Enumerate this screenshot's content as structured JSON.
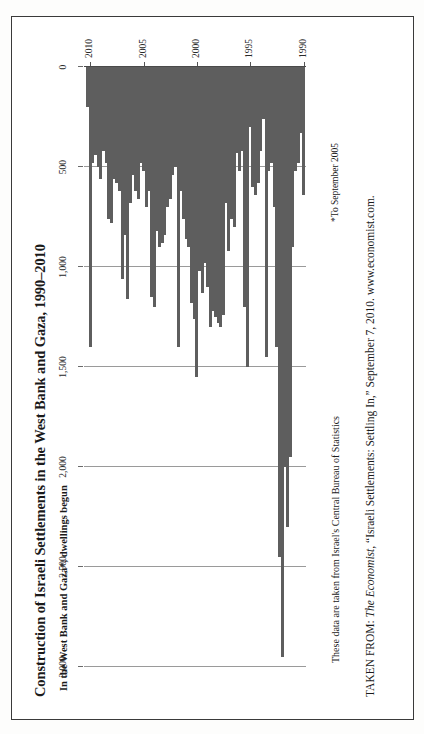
{
  "figure": {
    "title": "Construction of Israeli Settlements in the West Bank and Gaza, 1990–2010",
    "subtitle": "In the West Bank and Gaza*, dwellings begun",
    "footnote": "*To September 2005",
    "source_note": "These data are taken from Israel's Central Bureau of Statistics",
    "credit_prefix": "TAKEN FROM: ",
    "credit_italic": "The Economist",
    "credit_rest": ", “Israeli Settlements: Settling In,” September 7, 2010. www.economist.com.",
    "border_color": "#3a3a3a",
    "bar_color": "#5e5e5e",
    "grid_color": "#9a9a9a"
  },
  "chart_data": {
    "type": "bar",
    "title": "Construction of Israeli Settlements in the West Bank and Gaza, 1990–2010",
    "subtitle": "In the West Bank and Gaza*, dwellings begun",
    "orientation": "vertical-bars-printed-sideways",
    "xlabel": "",
    "ylabel": "dwellings begun",
    "ylim": [
      0,
      3000
    ],
    "yticks": [
      0,
      500,
      1000,
      1500,
      2000,
      2500,
      3000
    ],
    "ytick_labels": [
      "0",
      "500",
      "1,000",
      "1,500",
      "2,000",
      "2,500",
      "3,000"
    ],
    "grid": true,
    "legend": "none",
    "xticks": [
      1990,
      1995,
      2000,
      2005,
      2010
    ],
    "xtick_labels": [
      "1990",
      "1995",
      "2000",
      "2005",
      "2010"
    ],
    "frequency": "quarterly",
    "x": [
      1990.0,
      1990.25,
      1990.5,
      1990.75,
      1991.0,
      1991.25,
      1991.5,
      1991.75,
      1992.0,
      1992.25,
      1992.5,
      1992.75,
      1993.0,
      1993.25,
      1993.5,
      1993.75,
      1994.0,
      1994.25,
      1994.5,
      1994.75,
      1995.0,
      1995.25,
      1995.5,
      1995.75,
      1996.0,
      1996.25,
      1996.5,
      1996.75,
      1997.0,
      1997.25,
      1997.5,
      1997.75,
      1998.0,
      1998.25,
      1998.5,
      1998.75,
      1999.0,
      1999.25,
      1999.5,
      1999.75,
      2000.0,
      2000.25,
      2000.5,
      2000.75,
      2001.0,
      2001.25,
      2001.5,
      2001.75,
      2002.0,
      2002.25,
      2002.5,
      2002.75,
      2003.0,
      2003.25,
      2003.5,
      2003.75,
      2004.0,
      2004.25,
      2004.5,
      2004.75,
      2005.0,
      2005.25,
      2005.5,
      2005.75,
      2006.0,
      2006.25,
      2006.5,
      2006.75,
      2007.0,
      2007.25,
      2007.5,
      2007.75,
      2008.0,
      2008.25,
      2008.5,
      2008.75,
      2009.0,
      2009.25,
      2009.5,
      2009.75,
      2010.0,
      2010.25
    ],
    "values": [
      640,
      330,
      480,
      520,
      900,
      1950,
      2300,
      2000,
      2950,
      2450,
      1400,
      700,
      480,
      520,
      1450,
      260,
      420,
      580,
      640,
      600,
      300,
      1500,
      1200,
      420,
      520,
      430,
      800,
      760,
      920,
      680,
      1240,
      1300,
      1280,
      1250,
      1220,
      1300,
      1100,
      980,
      1130,
      1020,
      1550,
      1260,
      1180,
      900,
      860,
      760,
      620,
      1400,
      500,
      540,
      660,
      700,
      840,
      880,
      900,
      820,
      1200,
      1150,
      620,
      700,
      520,
      480,
      660,
      620,
      540,
      680,
      1160,
      840,
      1060,
      620,
      580,
      560,
      780,
      760,
      480,
      420,
      560,
      500,
      440,
      480,
      1400,
      200
    ]
  }
}
